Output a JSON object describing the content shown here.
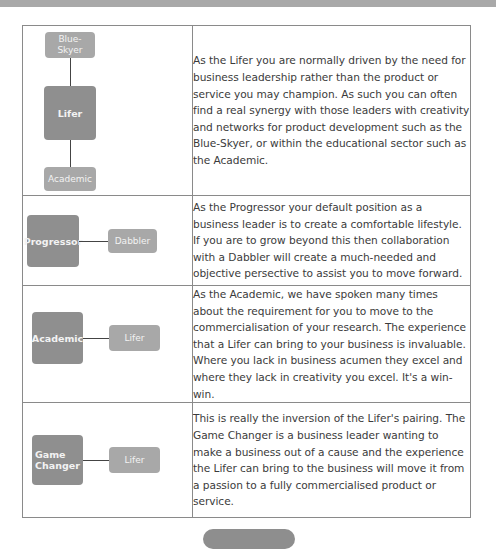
{
  "rows": [
    {
      "diagram": {
        "layout": "vertical",
        "main": "Lifer",
        "top": "Blue-\nSkyer",
        "bottom": "Academic"
      },
      "text": "As the Lifer you are normally driven by the need for business leadership rather than the product or service you may champion. As such you can often find a real synergy with those leaders with creativity and networks for product development such as the Blue-Skyer, or within the educational sector such as the Academic."
    },
    {
      "diagram": {
        "layout": "horizontal",
        "main": "Progressor",
        "partner": "Dabbler"
      },
      "text": "As the Progressor your default position as a business leader is to create a comfortable lifestyle. If you are to grow beyond this then collaboration with a Dabbler will create a much-needed and objective persective to assist you to move forward."
    },
    {
      "diagram": {
        "layout": "horizontal",
        "main": "Academic",
        "partner": "Lifer"
      },
      "text": "As the Academic, we have spoken many times about the requirement for you to move to the commercialisation of your research. The experience that a Lifer can bring to your business is invaluable. Where you lack in business acumen they excel and where they lack in creativity you excel. It's a win-win."
    },
    {
      "diagram": {
        "layout": "horizontal",
        "main": "Game\nChanger",
        "partner": "Lifer"
      },
      "text": "This is really the inversion of the Lifer's pairing. The Game Changer is a business leader wanting to make a business out of a cause and the experience the Lifer can bring to the business will move it from a passion to a fully commercialised product or service."
    }
  ],
  "colors": {
    "box_main": "#8f8f8f",
    "box_side": "#a8a8a8",
    "border": "#8a8a8a",
    "text": "#3b3b3b"
  }
}
